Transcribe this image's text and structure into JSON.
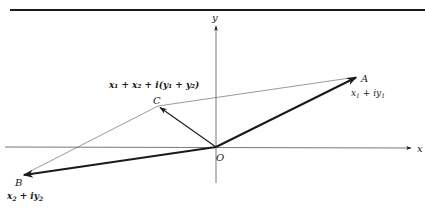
{
  "figure": {
    "axes": {
      "x_label": "x",
      "y_label": "y",
      "origin_label": "O"
    },
    "points": {
      "A": {
        "label": "A",
        "expr_main": "x",
        "expr_sub1": "1",
        "expr_mid": " + iy",
        "expr_sub2": "1"
      },
      "B": {
        "label": "B",
        "expr_main": "x",
        "expr_sub1": "2",
        "expr_mid": " + iy",
        "expr_sub2": "2"
      },
      "C": {
        "label": "C",
        "expr": "x₁ + x₂ + i(y₁ + y₂)"
      }
    },
    "colors": {
      "ink": "#1a1a1a",
      "thin_line": "#555555"
    }
  }
}
